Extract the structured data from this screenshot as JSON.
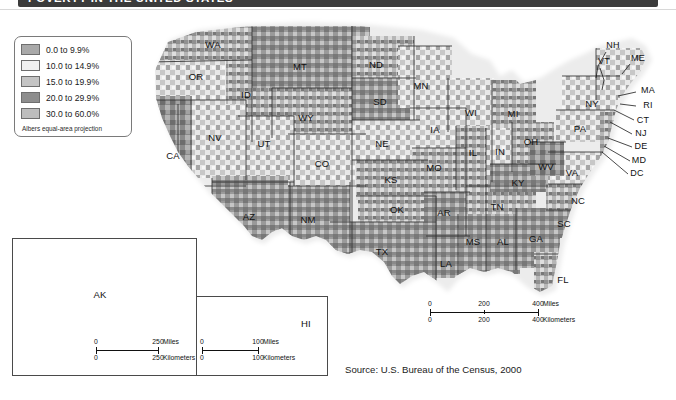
{
  "title": {
    "text": "POVERTY IN THE UNITED STATES"
  },
  "legend": {
    "note": "Albers equal-area projection",
    "items": [
      {
        "label": "0.0 to 9.9%",
        "color": "#a9a9a9"
      },
      {
        "label": "10.0 to 14.9%",
        "color": "#f0f0f0"
      },
      {
        "label": "15.0 to 19.9%",
        "color": "#c4c4c4"
      },
      {
        "label": "20.0 to 29.9%",
        "color": "#8d8d8d"
      },
      {
        "label": "30.0 to 60.0%",
        "color": "#bdbdbd"
      }
    ]
  },
  "source": {
    "text": "Source: U.S. Bureau of the Census, 2000"
  },
  "state_labels": [
    {
      "code": "WA",
      "x": 213,
      "y": 44
    },
    {
      "code": "OR",
      "x": 196,
      "y": 76
    },
    {
      "code": "ID",
      "x": 246,
      "y": 94
    },
    {
      "code": "MT",
      "x": 300,
      "y": 66
    },
    {
      "code": "ND",
      "x": 376,
      "y": 64
    },
    {
      "code": "SD",
      "x": 380,
      "y": 101
    },
    {
      "code": "MN",
      "x": 421,
      "y": 85
    },
    {
      "code": "WI",
      "x": 471,
      "y": 112
    },
    {
      "code": "MI",
      "x": 513,
      "y": 113
    },
    {
      "code": "WY",
      "x": 306,
      "y": 117
    },
    {
      "code": "NE",
      "x": 382,
      "y": 143
    },
    {
      "code": "IA",
      "x": 435,
      "y": 129
    },
    {
      "code": "IL",
      "x": 473,
      "y": 152
    },
    {
      "code": "IN",
      "x": 500,
      "y": 151
    },
    {
      "code": "OH",
      "x": 531,
      "y": 141
    },
    {
      "code": "NV",
      "x": 215,
      "y": 137
    },
    {
      "code": "UT",
      "x": 264,
      "y": 143
    },
    {
      "code": "CO",
      "x": 322,
      "y": 163
    },
    {
      "code": "KS",
      "x": 391,
      "y": 179
    },
    {
      "code": "MO",
      "x": 434,
      "y": 167
    },
    {
      "code": "KY",
      "x": 518,
      "y": 182
    },
    {
      "code": "CA",
      "x": 173,
      "y": 155
    },
    {
      "code": "AZ",
      "x": 249,
      "y": 216
    },
    {
      "code": "NM",
      "x": 308,
      "y": 219
    },
    {
      "code": "OK",
      "x": 397,
      "y": 209
    },
    {
      "code": "AR",
      "x": 444,
      "y": 212
    },
    {
      "code": "TN",
      "x": 497,
      "y": 206
    },
    {
      "code": "NC",
      "x": 578,
      "y": 200
    },
    {
      "code": "SC",
      "x": 564,
      "y": 223
    },
    {
      "code": "TX",
      "x": 382,
      "y": 251
    },
    {
      "code": "LA",
      "x": 446,
      "y": 263
    },
    {
      "code": "MS",
      "x": 473,
      "y": 241
    },
    {
      "code": "AL",
      "x": 503,
      "y": 241
    },
    {
      "code": "GA",
      "x": 536,
      "y": 238
    },
    {
      "code": "FL",
      "x": 563,
      "y": 279
    },
    {
      "code": "WV",
      "x": 546,
      "y": 166
    },
    {
      "code": "VA",
      "x": 572,
      "y": 172
    },
    {
      "code": "PA",
      "x": 580,
      "y": 128
    },
    {
      "code": "NY",
      "x": 592,
      "y": 103
    },
    {
      "code": "AK",
      "x": 100,
      "y": 294
    },
    {
      "code": "HI",
      "x": 306,
      "y": 323
    }
  ],
  "leader_labels": [
    {
      "code": "NH",
      "x": 613,
      "y": 45
    },
    {
      "code": "VT",
      "x": 604,
      "y": 61
    },
    {
      "code": "ME",
      "x": 638,
      "y": 58
    },
    {
      "code": "MA",
      "x": 648,
      "y": 90
    },
    {
      "code": "RI",
      "x": 648,
      "y": 105
    },
    {
      "code": "CT",
      "x": 643,
      "y": 120
    },
    {
      "code": "NJ",
      "x": 641,
      "y": 133
    },
    {
      "code": "DE",
      "x": 641,
      "y": 146
    },
    {
      "code": "MD",
      "x": 639,
      "y": 160
    },
    {
      "code": "DC",
      "x": 637,
      "y": 173
    }
  ],
  "scalebars": [
    {
      "name": "main-scalebar",
      "x": 430,
      "y": 300,
      "width": 108,
      "miles": {
        "ticks": [
          "0",
          "200",
          "400"
        ],
        "unit": "Miles"
      },
      "kilometers": {
        "ticks": [
          "0",
          "200",
          "400"
        ],
        "unit": "Kilometers"
      }
    },
    {
      "name": "alaska-scalebar",
      "x": 96,
      "y": 338,
      "width": 62,
      "miles": {
        "ticks": [
          "0",
          "250"
        ],
        "unit": "Miles"
      },
      "kilometers": {
        "ticks": [
          "0",
          "250"
        ],
        "unit": "Kilometers"
      }
    },
    {
      "name": "hawaii-scalebar",
      "x": 202,
      "y": 338,
      "width": 56,
      "miles": {
        "ticks": [
          "0",
          "100"
        ],
        "unit": "Miles"
      },
      "kilometers": {
        "ticks": [
          "0",
          "100"
        ],
        "unit": "Kilometers"
      }
    }
  ],
  "chart_data": {
    "type": "heatmap",
    "title": "POVERTY IN THE UNITED STATES",
    "subtitle": "",
    "xlabel": "",
    "ylabel": "",
    "legend_position": "top-left",
    "grid": false,
    "variable": "Percent of persons below poverty level, by county",
    "units": "percent",
    "projection": "Albers equal-area projection",
    "source": "U.S. Bureau of the Census, 2000",
    "categories": [
      "0.0 to 9.9%",
      "10.0 to 14.9%",
      "15.0 to 19.9%",
      "20.0 to 29.9%",
      "30.0 to 60.0%"
    ],
    "class_breaks": [
      0.0,
      10.0,
      15.0,
      20.0,
      30.0,
      60.0
    ],
    "colors": [
      "#a9a9a9",
      "#f0f0f0",
      "#c4c4c4",
      "#8d8d8d",
      "#bdbdbd"
    ],
    "regions": [
      {
        "name": "WA",
        "class": "15.0 to 19.9%"
      },
      {
        "name": "OR",
        "class": "10.0 to 14.9%"
      },
      {
        "name": "ID",
        "class": "15.0 to 19.9%"
      },
      {
        "name": "MT",
        "class": "20.0 to 29.9%"
      },
      {
        "name": "ND",
        "class": "15.0 to 19.9%"
      },
      {
        "name": "SD",
        "class": "20.0 to 29.9%"
      },
      {
        "name": "MN",
        "class": "10.0 to 14.9%"
      },
      {
        "name": "WI",
        "class": "10.0 to 14.9%"
      },
      {
        "name": "MI",
        "class": "15.0 to 19.9%"
      },
      {
        "name": "WY",
        "class": "15.0 to 19.9%"
      },
      {
        "name": "NE",
        "class": "10.0 to 14.9%"
      },
      {
        "name": "IA",
        "class": "10.0 to 14.9%"
      },
      {
        "name": "IL",
        "class": "15.0 to 19.9%"
      },
      {
        "name": "IN",
        "class": "10.0 to 14.9%"
      },
      {
        "name": "OH",
        "class": "15.0 to 19.9%"
      },
      {
        "name": "NV",
        "class": "10.0 to 14.9%"
      },
      {
        "name": "UT",
        "class": "10.0 to 14.9%"
      },
      {
        "name": "CO",
        "class": "10.0 to 14.9%"
      },
      {
        "name": "KS",
        "class": "15.0 to 19.9%"
      },
      {
        "name": "MO",
        "class": "15.0 to 19.9%"
      },
      {
        "name": "KY",
        "class": "20.0 to 29.9%"
      },
      {
        "name": "CA",
        "class": "15.0 to 19.9%"
      },
      {
        "name": "AZ",
        "class": "20.0 to 29.9%"
      },
      {
        "name": "NM",
        "class": "20.0 to 29.9%"
      },
      {
        "name": "OK",
        "class": "15.0 to 19.9%"
      },
      {
        "name": "AR",
        "class": "20.0 to 29.9%"
      },
      {
        "name": "TN",
        "class": "15.0 to 19.9%"
      },
      {
        "name": "NC",
        "class": "15.0 to 19.9%"
      },
      {
        "name": "SC",
        "class": "20.0 to 29.9%"
      },
      {
        "name": "TX",
        "class": "20.0 to 29.9%"
      },
      {
        "name": "LA",
        "class": "20.0 to 29.9%"
      },
      {
        "name": "MS",
        "class": "20.0 to 29.9%"
      },
      {
        "name": "AL",
        "class": "20.0 to 29.9%"
      },
      {
        "name": "GA",
        "class": "20.0 to 29.9%"
      },
      {
        "name": "FL",
        "class": "15.0 to 19.9%"
      },
      {
        "name": "WV",
        "class": "20.0 to 29.9%"
      },
      {
        "name": "VA",
        "class": "10.0 to 14.9%"
      },
      {
        "name": "PA",
        "class": "10.0 to 14.9%"
      },
      {
        "name": "NY",
        "class": "10.0 to 14.9%"
      },
      {
        "name": "NH",
        "class": "0.0 to 9.9%"
      },
      {
        "name": "VT",
        "class": "10.0 to 14.9%"
      },
      {
        "name": "ME",
        "class": "10.0 to 14.9%"
      },
      {
        "name": "MA",
        "class": "10.0 to 14.9%"
      },
      {
        "name": "RI",
        "class": "10.0 to 14.9%"
      },
      {
        "name": "CT",
        "class": "0.0 to 9.9%"
      },
      {
        "name": "NJ",
        "class": "0.0 to 9.9%"
      },
      {
        "name": "DE",
        "class": "10.0 to 14.9%"
      },
      {
        "name": "MD",
        "class": "0.0 to 9.9%"
      },
      {
        "name": "DC",
        "class": "20.0 to 29.9%"
      },
      {
        "name": "AK",
        "class": "20.0 to 29.9%"
      },
      {
        "name": "HI",
        "class": "15.0 to 19.9%"
      }
    ]
  }
}
